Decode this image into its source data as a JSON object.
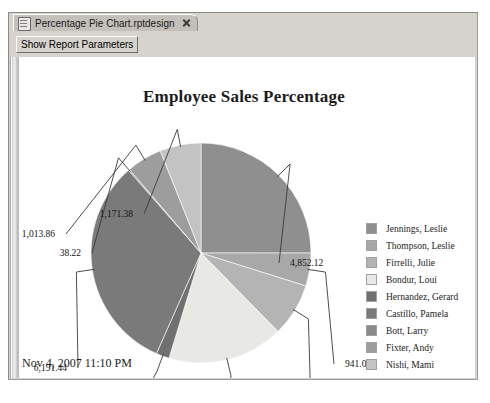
{
  "window": {
    "tab": {
      "label": "Percentage Pie Chart.rptdesign",
      "doc_icon": "document-icon",
      "close_icon": "close-icon"
    },
    "toolbar": {
      "show_parameters_label": "Show Report Parameters"
    }
  },
  "report": {
    "timestamp": "Nov 4, 2007 11:10 PM"
  },
  "chart_data": {
    "type": "pie",
    "title": "Employee Sales Percentage",
    "xlabel": "",
    "ylabel": "",
    "legend_position": "right",
    "grid": false,
    "categories": [
      "Jennings, Leslie",
      "Thompson, Leslie",
      "Firrelli, Julie",
      "Bondur, Loui",
      "Hernandez, Gerard",
      "Castillo, Pamela",
      "Bott, Larry",
      "Fixter, Andy",
      "Nishi, Mami"
    ],
    "values": [
      4852.12,
      941.08,
      1515.86,
      3306.37,
      376.35,
      6191.44,
      38.22,
      1013.86,
      1171.38
    ],
    "labels": [
      "4,852.12",
      "941.08",
      "1,515.86",
      "3,306.37",
      "376.35",
      "6,191.44",
      "38.22",
      "1,013.86",
      "1,171.38"
    ],
    "colors": [
      "#8f8f8f",
      "#a8a8a8",
      "#b4b4b4",
      "#e8e8e4",
      "#707070",
      "#7a7a7a",
      "#8a8a8a",
      "#9d9d9d",
      "#c3c3c3"
    ],
    "total": 19406.68
  }
}
